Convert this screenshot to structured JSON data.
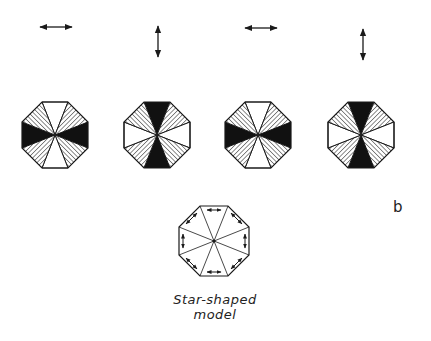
{
  "figure": {
    "panel_label": "b",
    "caption_line1": "Star-shaped",
    "caption_line2": "model",
    "colors": {
      "ink": "#1a1a1a",
      "background": "#ffffff"
    },
    "polarization_arrows": [
      {
        "orientation": "horizontal",
        "icon": "double-arrow-horizontal-icon"
      },
      {
        "orientation": "vertical",
        "icon": "double-arrow-vertical-icon"
      },
      {
        "orientation": "horizontal",
        "icon": "double-arrow-horizontal-icon"
      },
      {
        "orientation": "vertical",
        "icon": "double-arrow-vertical-icon"
      }
    ],
    "octagons": [
      {
        "dark_sectors": "left-right",
        "white_sectors": "top-bottom",
        "hatched_sectors": "diagonals"
      },
      {
        "dark_sectors": "top-bottom",
        "white_sectors": "left-right",
        "hatched_sectors": "diagonals"
      },
      {
        "dark_sectors": "left-right",
        "white_sectors": "top-bottom",
        "hatched_sectors": "diagonals"
      },
      {
        "dark_sectors": "top-bottom",
        "white_sectors": "left-right",
        "hatched_sectors": "diagonals"
      }
    ],
    "model": {
      "name": "star-shaped-model",
      "edge_arrows": "double-headed arrows along each of 8 edges"
    }
  }
}
